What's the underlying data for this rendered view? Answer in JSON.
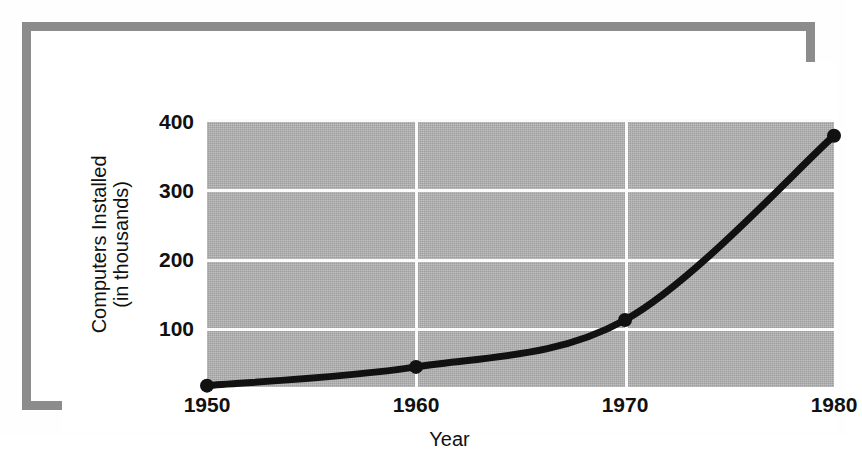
{
  "chart_data": {
    "type": "line",
    "title": "",
    "xlabel": "Year",
    "ylabel": "Computers Installed (in thousands)",
    "ylabel_line1": "Computers Installed",
    "ylabel_line2": "(in thousands)",
    "x": [
      1950,
      1960,
      1970,
      1980
    ],
    "values": [
      2,
      30,
      100,
      375
    ],
    "series": [
      {
        "name": "Computers Installed",
        "values": [
          2,
          30,
          100,
          375
        ]
      }
    ],
    "categories": [
      "1950",
      "1960",
      "1970",
      "1980"
    ],
    "xticks": [
      "1950",
      "1960",
      "1970",
      "1980"
    ],
    "yticks": [
      "100",
      "200",
      "300",
      "400"
    ],
    "xlim": [
      1950,
      1980
    ],
    "ylim": [
      0,
      400
    ],
    "grid": true,
    "legend": "none",
    "marker": "filled-circle",
    "line_color": "#111111",
    "plot_background": "#a9a9a9",
    "grid_color": "#fbfbfb",
    "frame_color": "#8c8c8c"
  }
}
